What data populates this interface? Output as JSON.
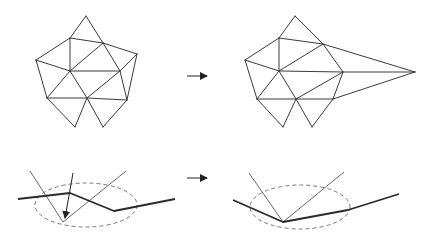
{
  "diagram": {
    "colors": {
      "stroke": "#3a3a3a",
      "background": "#ffffff",
      "ellipse": "#777777"
    },
    "top_left_mesh": {
      "vertices": {
        "top": [
          86,
          16
        ],
        "ul": [
          70,
          38
        ],
        "umr": [
          103,
          43
        ],
        "fl": [
          36,
          60
        ],
        "fr": [
          137,
          54
        ],
        "c": [
          70,
          71
        ],
        "rc": [
          120,
          71
        ],
        "ll": [
          47,
          98
        ],
        "lc": [
          87,
          98
        ],
        "lr": [
          127,
          100
        ],
        "bl": [
          75,
          127
        ],
        "br": [
          103,
          127
        ]
      },
      "edges": [
        [
          "top",
          "ul"
        ],
        [
          "top",
          "umr"
        ],
        [
          "ul",
          "umr"
        ],
        [
          "ul",
          "fl"
        ],
        [
          "ul",
          "c"
        ],
        [
          "umr",
          "fr"
        ],
        [
          "umr",
          "c"
        ],
        [
          "umr",
          "rc"
        ],
        [
          "fl",
          "c"
        ],
        [
          "fl",
          "ll"
        ],
        [
          "fr",
          "rc"
        ],
        [
          "fr",
          "lr"
        ],
        [
          "c",
          "rc"
        ],
        [
          "c",
          "ll"
        ],
        [
          "c",
          "lc"
        ],
        [
          "rc",
          "lc"
        ],
        [
          "rc",
          "lr"
        ],
        [
          "ll",
          "lc"
        ],
        [
          "lc",
          "lr"
        ],
        [
          "ll",
          "bl"
        ],
        [
          "bl",
          "lc"
        ],
        [
          "lc",
          "br"
        ],
        [
          "br",
          "lr"
        ]
      ]
    },
    "top_right_mesh": {
      "vertices": {
        "top": [
          295,
          16
        ],
        "ul": [
          279,
          38
        ],
        "umr": [
          323,
          44
        ],
        "fl": [
          245,
          60
        ],
        "fp": [
          415,
          72
        ],
        "c": [
          279,
          71
        ],
        "rc": [
          343,
          72
        ],
        "ll": [
          257,
          99
        ],
        "lc": [
          296,
          99
        ],
        "lr": [
          333,
          99
        ],
        "bl": [
          283,
          127
        ],
        "br": [
          312,
          127
        ]
      },
      "edges": [
        [
          "top",
          "ul"
        ],
        [
          "top",
          "umr"
        ],
        [
          "ul",
          "umr"
        ],
        [
          "ul",
          "fl"
        ],
        [
          "ul",
          "c"
        ],
        [
          "umr",
          "fp"
        ],
        [
          "umr",
          "c"
        ],
        [
          "umr",
          "rc"
        ],
        [
          "fl",
          "c"
        ],
        [
          "fl",
          "ll"
        ],
        [
          "rc",
          "fp"
        ],
        [
          "lr",
          "fp"
        ],
        [
          "c",
          "rc"
        ],
        [
          "c",
          "ll"
        ],
        [
          "c",
          "lc"
        ],
        [
          "rc",
          "lc"
        ],
        [
          "rc",
          "lr"
        ],
        [
          "ll",
          "lc"
        ],
        [
          "lc",
          "lr"
        ],
        [
          "ll",
          "bl"
        ],
        [
          "bl",
          "lc"
        ],
        [
          "lc",
          "br"
        ],
        [
          "br",
          "lr"
        ]
      ]
    },
    "arrows": [
      {
        "name": "top-transition-arrow",
        "from": [
          187,
          76
        ],
        "to": [
          207,
          76
        ]
      },
      {
        "name": "bottom-transition-arrow",
        "from": [
          187,
          178
        ],
        "to": [
          207,
          178
        ]
      }
    ],
    "bottom_left": {
      "polyline": [
        [
          18,
          199
        ],
        [
          70,
          193
        ],
        [
          114,
          211
        ],
        [
          175,
          199
        ]
      ],
      "thin_lines": [
        [
          [
            30,
            171
          ],
          [
            63,
            222
          ]
        ],
        [
          [
            63,
            222
          ],
          [
            126,
            171
          ]
        ]
      ],
      "move_arrow": {
        "from": [
          73,
          173
        ],
        "to": [
          65,
          218
        ]
      },
      "ellipse": {
        "cx": 86,
        "cy": 205,
        "rx": 51,
        "ry": 22
      }
    },
    "bottom_right": {
      "polyline": [
        [
          233,
          200
        ],
        [
          283,
          222
        ],
        [
          348,
          210
        ],
        [
          399,
          194
        ]
      ],
      "thin_lines": [
        [
          [
            249,
            173
          ],
          [
            283,
            222
          ]
        ],
        [
          [
            283,
            222
          ],
          [
            344,
            172
          ]
        ]
      ],
      "ellipse": {
        "cx": 300,
        "cy": 207,
        "rx": 50,
        "ry": 22
      }
    }
  }
}
